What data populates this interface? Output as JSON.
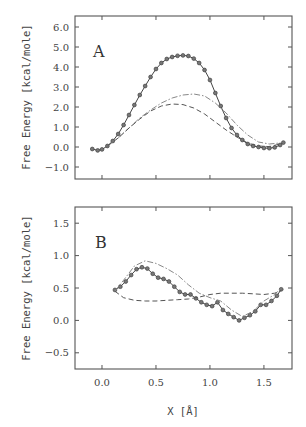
{
  "chart_data": [
    {
      "type": "line",
      "panel": "A",
      "title": "A",
      "xlabel": "X [Å]",
      "ylabel": "Free Energy  [kcal/mole]",
      "xlim": [
        -0.25,
        1.76
      ],
      "ylim": [
        -1.6,
        6.55
      ],
      "xticks": [
        0.0,
        0.5,
        1.0,
        1.5
      ],
      "yticks": [
        -1.0,
        0.0,
        1.0,
        2.0,
        3.0,
        4.0,
        5.0,
        6.0
      ],
      "ytick_labels": [
        "−1.0",
        "0.0",
        "1.0",
        "2.0",
        "3.0",
        "4.0",
        "5.0",
        "6.0"
      ],
      "grid": false,
      "series": [
        {
          "name": "solid-with-circles",
          "style": "solid-markers",
          "x": [
            -0.09,
            -0.04,
            0.0,
            0.05,
            0.1,
            0.15,
            0.2,
            0.25,
            0.3,
            0.35,
            0.4,
            0.45,
            0.5,
            0.55,
            0.6,
            0.65,
            0.7,
            0.75,
            0.8,
            0.85,
            0.9,
            0.95,
            1.0,
            1.05,
            1.1,
            1.15,
            1.2,
            1.25,
            1.3,
            1.35,
            1.4,
            1.45,
            1.5,
            1.55,
            1.6,
            1.65,
            1.68
          ],
          "y": [
            -0.1,
            -0.17,
            -0.12,
            0.05,
            0.3,
            0.65,
            1.1,
            1.6,
            2.1,
            2.6,
            3.05,
            3.5,
            3.9,
            4.2,
            4.4,
            4.5,
            4.56,
            4.58,
            4.55,
            4.42,
            4.2,
            3.85,
            3.35,
            2.7,
            2.05,
            1.45,
            0.95,
            0.6,
            0.35,
            0.15,
            0.05,
            0.0,
            -0.05,
            -0.06,
            -0.02,
            0.1,
            0.22
          ]
        },
        {
          "name": "dash-dot",
          "style": "dashdot",
          "x": [
            0.05,
            0.15,
            0.25,
            0.35,
            0.45,
            0.55,
            0.65,
            0.75,
            0.85,
            0.95,
            1.05,
            1.15,
            1.25,
            1.35,
            1.45,
            1.55,
            1.65
          ],
          "y": [
            0.05,
            0.45,
            0.95,
            1.45,
            1.85,
            2.2,
            2.45,
            2.6,
            2.65,
            2.55,
            2.2,
            1.7,
            1.1,
            0.6,
            0.25,
            0.15,
            0.2
          ]
        },
        {
          "name": "dashed",
          "style": "dashed",
          "x": [
            0.05,
            0.15,
            0.25,
            0.35,
            0.45,
            0.55,
            0.65,
            0.75,
            0.85,
            0.95,
            1.05,
            1.15,
            1.25,
            1.35,
            1.45,
            1.55,
            1.65
          ],
          "y": [
            0.05,
            0.45,
            0.95,
            1.4,
            1.8,
            2.05,
            2.15,
            2.12,
            1.95,
            1.65,
            1.25,
            0.85,
            0.5,
            0.2,
            0.05,
            0.02,
            0.15
          ]
        }
      ]
    },
    {
      "type": "line",
      "panel": "B",
      "title": "B",
      "xlabel": "X [Å]",
      "ylabel": "Free Energy  [kcal/mole]",
      "xlim": [
        -0.25,
        1.76
      ],
      "ylim": [
        -0.75,
        1.75
      ],
      "xticks": [
        0.0,
        0.5,
        1.0,
        1.5
      ],
      "xtick_labels": [
        "0.0",
        "0.5",
        "1.0",
        "1.5"
      ],
      "yticks": [
        -0.5,
        0.0,
        0.5,
        1.0,
        1.5
      ],
      "ytick_labels": [
        "−0.5",
        "0.0",
        "0.5",
        "1.0",
        "1.5"
      ],
      "grid": false,
      "series": [
        {
          "name": "solid-with-circles",
          "style": "solid-markers",
          "x": [
            0.12,
            0.17,
            0.22,
            0.27,
            0.32,
            0.37,
            0.42,
            0.47,
            0.52,
            0.57,
            0.62,
            0.67,
            0.72,
            0.77,
            0.82,
            0.87,
            0.92,
            0.97,
            1.02,
            1.07,
            1.12,
            1.17,
            1.22,
            1.27,
            1.32,
            1.37,
            1.42,
            1.47,
            1.52,
            1.57,
            1.62,
            1.66
          ],
          "y": [
            0.47,
            0.52,
            0.6,
            0.7,
            0.79,
            0.82,
            0.8,
            0.72,
            0.66,
            0.64,
            0.6,
            0.52,
            0.44,
            0.4,
            0.4,
            0.34,
            0.28,
            0.24,
            0.22,
            0.28,
            0.16,
            0.1,
            0.05,
            0.0,
            0.04,
            0.08,
            0.14,
            0.24,
            0.24,
            0.3,
            0.38,
            0.48
          ]
        },
        {
          "name": "dash-dot",
          "style": "dashdot",
          "x": [
            0.12,
            0.2,
            0.3,
            0.4,
            0.5,
            0.6,
            0.7,
            0.8,
            0.9,
            1.0,
            1.1,
            1.2,
            1.3,
            1.4,
            1.5,
            1.6,
            1.66
          ],
          "y": [
            0.45,
            0.62,
            0.84,
            0.92,
            0.88,
            0.8,
            0.7,
            0.55,
            0.42,
            0.35,
            0.3,
            0.16,
            0.06,
            0.14,
            0.3,
            0.4,
            0.5
          ]
        },
        {
          "name": "dashed",
          "style": "dashed",
          "x": [
            0.12,
            0.2,
            0.3,
            0.4,
            0.5,
            0.6,
            0.7,
            0.8,
            0.9,
            1.0,
            1.1,
            1.2,
            1.3,
            1.4,
            1.5,
            1.6,
            1.66
          ],
          "y": [
            0.45,
            0.35,
            0.31,
            0.3,
            0.3,
            0.31,
            0.32,
            0.33,
            0.36,
            0.4,
            0.42,
            0.42,
            0.42,
            0.41,
            0.4,
            0.42,
            0.46
          ]
        }
      ]
    }
  ],
  "labels": {
    "panel_a": "A",
    "panel_b": "B",
    "ylabel": "Free Energy  [kcal/mole]",
    "xlabel": "X [Å]"
  },
  "colors": {
    "axis": "#555555",
    "solid": "#444444",
    "marker_fill": "#777777",
    "dashed": "#555555",
    "dashdot": "#888888"
  }
}
